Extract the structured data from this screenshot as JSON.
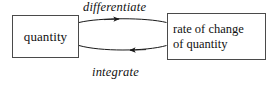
{
  "diagram": {
    "type": "cycle-diagram",
    "background_color": "#ffffff",
    "stroke_color": "#4a4a4a",
    "text_color": "#111111",
    "nodes": [
      {
        "id": "quantity",
        "label": "quantity"
      },
      {
        "id": "rate-of-change",
        "label": "rate of change\nof quantity"
      }
    ],
    "edges": [
      {
        "id": "differentiate",
        "label": "differentiate",
        "from": "quantity",
        "to": "rate-of-change",
        "direction": "right",
        "style": "curved-arrow-italic-label"
      },
      {
        "id": "integrate",
        "label": "integrate",
        "from": "rate-of-change",
        "to": "quantity",
        "direction": "left",
        "style": "curved-arrow-italic-label"
      }
    ]
  }
}
